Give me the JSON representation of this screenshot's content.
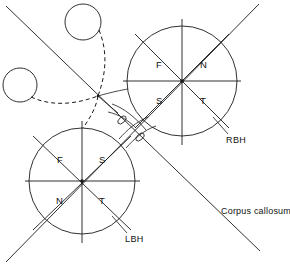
{
  "figure": {
    "background_color": "#ffffff",
    "stroke_color": "#1a1a1a",
    "width": 290,
    "height": 268
  },
  "labels": {
    "corpus_callosum": "Corpus callosum",
    "right_hemisphere": "RBH",
    "left_hemisphere": "LBH"
  },
  "right_circle": {
    "name": "RBH",
    "center": {
      "x": 182,
      "y": 81
    },
    "radius": 55,
    "quadrants": {
      "upper_left": "F",
      "upper_right": "N",
      "lower_left": "S",
      "lower_right": "T"
    }
  },
  "left_circle": {
    "name": "LBH",
    "center": {
      "x": 82,
      "y": 181
    },
    "radius": 53,
    "quadrants": {
      "upper_left": "F",
      "upper_right": "S",
      "lower_left": "N",
      "lower_right": "T"
    }
  },
  "small_circles": [
    {
      "name": "upper-eye",
      "center": {
        "x": 83,
        "y": 22
      },
      "radius": 18
    },
    {
      "name": "left-eye",
      "center": {
        "x": 20,
        "y": 85
      },
      "radius": 17
    }
  ],
  "chiasm": {
    "name": "optic-chiasm",
    "ellipses": [
      {
        "cx": 122,
        "cy": 120,
        "rx": 5.0,
        "ry": 2.8,
        "rotate": -42
      },
      {
        "cx": 140,
        "cy": 136,
        "rx": 5.0,
        "ry": 2.8,
        "rotate": -42
      }
    ]
  },
  "diagonals": [
    {
      "name": "ascending-diagonal",
      "from": {
        "x": 8,
        "y": 8
      },
      "to": {
        "x": 258,
        "y": 4
      }
    },
    {
      "name": "descending-diagonal",
      "from": {
        "x": 8,
        "y": 260
      },
      "to": {
        "x": 260,
        "y": 250
      }
    }
  ]
}
